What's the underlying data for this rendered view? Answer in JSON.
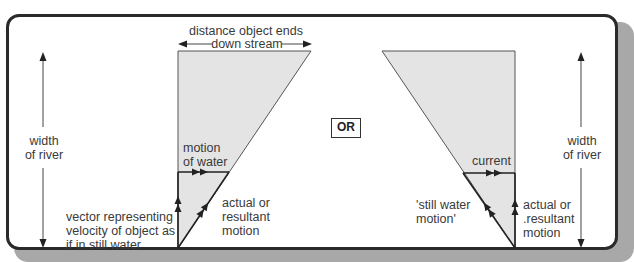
{
  "colors": {
    "frame_border": "#2a2a2a",
    "shadow": "#a8a8a8",
    "triangle_fill": "#e4e4e4",
    "line": "#222222",
    "text": "#3a3a3a"
  },
  "separator": {
    "label": "OR"
  },
  "left_diagram": {
    "width_arrow_label": "width\nof river",
    "top_dimension_label_line1": "distance object ends",
    "top_dimension_label_line2": "down stream",
    "horizontal_vector_label": "motion\nof water",
    "hypotenuse_vector_label": "actual or\nresultant\nmotion",
    "vertical_vector_label": "vector representing\nvelocity of object as\nif in still water"
  },
  "right_diagram": {
    "width_arrow_label": "width\nof river",
    "horizontal_vector_label": "current",
    "hypotenuse_vector_label": "'still water\nmotion'",
    "vertical_vector_label": "actual or\n.resultant\nmotion"
  }
}
